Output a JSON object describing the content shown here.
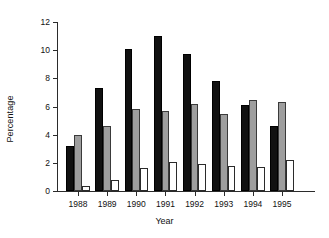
{
  "chart_data": {
    "type": "bar",
    "title": "",
    "xlabel": "Year",
    "ylabel": "Percentage",
    "categories": [
      "1988",
      "1989",
      "1990",
      "1991",
      "1992",
      "1993",
      "1994",
      "1995"
    ],
    "series": [
      {
        "name": "series-1-black",
        "color": "#111111",
        "values": [
          3.2,
          7.3,
          10.1,
          11.0,
          9.7,
          7.8,
          6.1,
          4.6
        ]
      },
      {
        "name": "series-2-gray",
        "color": "#9e9e9e",
        "values": [
          4.0,
          4.65,
          5.8,
          5.65,
          6.2,
          5.45,
          6.45,
          6.35
        ]
      },
      {
        "name": "series-3-white",
        "color": "#ffffff",
        "values": [
          0.35,
          0.8,
          1.65,
          2.05,
          1.9,
          1.8,
          1.7,
          2.2
        ]
      }
    ],
    "ylim": [
      0,
      12
    ],
    "yticks": [
      0,
      2,
      4,
      6,
      8,
      10,
      12
    ],
    "ytick_labels": [
      "0",
      "2",
      "4",
      "6",
      "8",
      "10",
      "12"
    ],
    "grid": false,
    "legend": "none"
  }
}
